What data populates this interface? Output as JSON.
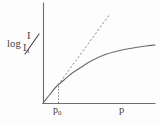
{
  "figure": {
    "background_color": "#fdfdfd",
    "axis_color": "#6e6e6e",
    "curve_color": "#6a6a6a",
    "dashed_color": "#8a8a8a"
  },
  "labels": {
    "ylabel_prefix": "log",
    "ylabel_numerator": "I",
    "ylabel_denominator": "I",
    "ylabel_denominator_sub": "1",
    "xlabel_threshold": "p",
    "xlabel_threshold_sub": "0",
    "xlabel_axis": "p"
  },
  "chart_data": {
    "type": "line",
    "title": "",
    "xlabel": "p",
    "ylabel": "log I/I1",
    "grid": false,
    "legend": null,
    "axes": {
      "x_origin_px": 43,
      "y_origin_px": 103,
      "x_end_px": 155,
      "y_top_px": 3,
      "x_ticks": [
        "p0"
      ],
      "x_tick_positions_px": [
        58
      ],
      "y_ticks": []
    },
    "annotations": [
      {
        "name": "threshold-dropline",
        "text": "p0",
        "x_px": 58,
        "y_from_px": 103,
        "y_to_px": 85,
        "style": "dotted"
      }
    ],
    "series": [
      {
        "name": "measured-response",
        "style": "solid",
        "description": "Linear rise from origin to threshold p0, then saturating logarithmic bend toward the right edge.",
        "points_px": [
          [
            43,
            103
          ],
          [
            47,
            98
          ],
          [
            51,
            93
          ],
          [
            55,
            88
          ],
          [
            58,
            85
          ],
          [
            64,
            80
          ],
          [
            71,
            74
          ],
          [
            80,
            68
          ],
          [
            91,
            61
          ],
          [
            104,
            55
          ],
          [
            118,
            51
          ],
          [
            133,
            48
          ],
          [
            146,
            46
          ],
          [
            155,
            45
          ]
        ]
      },
      {
        "name": "initial-slope-extrapolation",
        "style": "dashed",
        "description": "Straight tangent extending the pre-threshold slope beyond p0.",
        "points_px": [
          [
            58,
            85
          ],
          [
            110,
            14
          ]
        ]
      }
    ]
  }
}
